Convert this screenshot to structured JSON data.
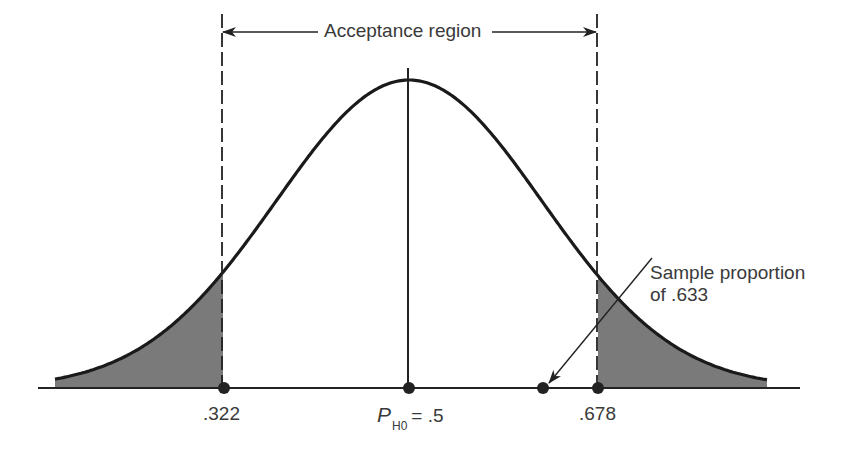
{
  "figure": {
    "title": "Acceptance region",
    "labels": {
      "critical_left": ".322",
      "critical_right": ".678",
      "mean_symbol": "P",
      "mean_subscript": "H0",
      "mean_value": "= .5",
      "sample_line1": "Sample proportion",
      "sample_line2": "of .633"
    },
    "colors": {
      "ink": "#222222",
      "shade": "#7a7a7a",
      "text": "#3a3a3a",
      "background": "#ffffff"
    }
  },
  "chart_data": {
    "type": "area",
    "title": "Acceptance region",
    "distribution": "normal",
    "mean": 0.5,
    "critical_values": [
      0.322,
      0.678
    ],
    "acceptance_region": [
      0.322,
      0.678
    ],
    "rejection_regions_shaded": [
      [
        "left tail",
        0.322
      ],
      [
        0.678,
        "right tail"
      ]
    ],
    "sample_proportion": 0.633,
    "x_tick_labels": [
      ".322",
      "P_H0 = .5",
      ".678"
    ],
    "annotations": [
      "Acceptance region",
      "Sample proportion of .633"
    ],
    "xlabel": "",
    "ylabel": "",
    "grid": false,
    "legend": "none"
  }
}
